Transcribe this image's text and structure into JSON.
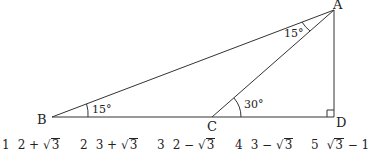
{
  "figure": {
    "points": {
      "A": {
        "label": "A"
      },
      "B": {
        "label": "B"
      },
      "C": {
        "label": "C"
      },
      "D": {
        "label": "D"
      }
    },
    "angles": {
      "ABC": "15°",
      "BAC": "15°",
      "ACD": "30°"
    },
    "right_angle_at": "D"
  },
  "choices": [
    {
      "num": "1",
      "pre": "2 + ",
      "rad": "3",
      "post": ""
    },
    {
      "num": "2",
      "pre": "3 + ",
      "rad": "3",
      "post": ""
    },
    {
      "num": "3",
      "pre": "2 − ",
      "rad": "3",
      "post": ""
    },
    {
      "num": "4",
      "pre": "3 − ",
      "rad": "3",
      "post": ""
    },
    {
      "num": "5",
      "pre": "",
      "rad": "3",
      "post": " − 1"
    }
  ]
}
